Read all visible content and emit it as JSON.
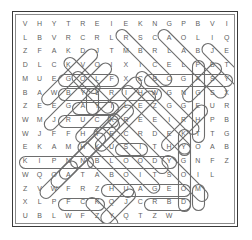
{
  "puzzle": {
    "title": "word-search-grid",
    "columns": 15,
    "rows": 15,
    "letter_color": "#5f5f5f",
    "mark_color": "#6d6d6d",
    "frame_color": "#3a3a3a",
    "inner_frame_color": "#8a8a8a",
    "background_color": "#ffffff",
    "grid": [
      [
        "V",
        "H",
        "Y",
        "T",
        "R",
        "E",
        "I",
        "E",
        "K",
        "N",
        "G",
        "P",
        "B",
        "V",
        "I"
      ],
      [
        "L",
        "B",
        "V",
        "R",
        "C",
        "R",
        "L",
        "R",
        "S",
        "C",
        "A",
        "O",
        "L",
        "I",
        "Q"
      ],
      [
        "Z",
        "F",
        "A",
        "K",
        "D",
        "J",
        "T",
        "M",
        "B",
        "R",
        "L",
        "A",
        "B",
        "J",
        "E"
      ],
      [
        "D",
        "L",
        "C",
        "K",
        "V",
        "O",
        "I",
        "X",
        "I",
        "C",
        "E",
        "L",
        "P",
        "B",
        "T"
      ],
      [
        "M",
        "U",
        "E",
        "G",
        "O",
        "L",
        "F",
        "X",
        "C",
        "B",
        "O",
        "G",
        "A",
        "S",
        "Y"
      ],
      [
        "B",
        "A",
        "W",
        "B",
        "Y",
        "L",
        "R",
        "I",
        "H",
        "W",
        "G",
        "N",
        "G",
        "S",
        "X"
      ],
      [
        "Z",
        "E",
        "E",
        "G",
        "A",
        "Y",
        "I",
        "L",
        "E",
        "Z",
        "G",
        "G",
        "E",
        "U",
        "R"
      ],
      [
        "W",
        "M",
        "J",
        "R",
        "U",
        "C",
        "K",
        "R",
        "E",
        "E",
        "I",
        "R",
        "H",
        "P",
        "B"
      ],
      [
        "W",
        "J",
        "F",
        "F",
        "H",
        "T",
        "E",
        "C",
        "R",
        "D",
        "E",
        "K",
        "T",
        "T",
        "G"
      ],
      [
        "E",
        "K",
        "A",
        "M",
        "H",
        "K",
        "U",
        "S",
        "I",
        "T",
        "H",
        "Y",
        "O",
        "A",
        "B"
      ],
      [
        "K",
        "I",
        "P",
        "N",
        "N",
        "B",
        "L",
        "O",
        "O",
        "D",
        "Y",
        "G",
        "N",
        "F",
        "Z"
      ],
      [
        "W",
        "Q",
        "O",
        "A",
        "T",
        "A",
        "B",
        "O",
        "I",
        "T",
        "S",
        "O",
        "I",
        "L",
        ""
      ],
      [
        "Z",
        "V",
        "W",
        "F",
        "R",
        "Z",
        "H",
        "U",
        "A",
        "G",
        "E",
        "O",
        "M",
        "",
        ""
      ],
      [
        "X",
        "L",
        "P",
        "F",
        "C",
        "K",
        "Q",
        "J",
        "C",
        "R",
        "B",
        "D",
        "",
        "",
        ""
      ],
      [
        "U",
        "B",
        "L",
        "W",
        "F",
        "Z",
        "Y",
        "Q",
        "T",
        "Z",
        "W",
        "",
        "",
        "",
        ""
      ]
    ],
    "found_words": [
      {
        "word": "GOLF",
        "start": [
          4,
          3
        ],
        "end": [
          4,
          6
        ],
        "orientation": "horizontal"
      },
      {
        "word": "BLOODY",
        "start": [
          10,
          5
        ],
        "end": [
          10,
          10
        ],
        "orientation": "horizontal"
      },
      {
        "word": "RUCK",
        "start": [
          7,
          3
        ],
        "end": [
          7,
          6
        ],
        "orientation": "horizontal"
      },
      {
        "word": "KIPNN",
        "start": [
          10,
          0
        ],
        "end": [
          10,
          4
        ],
        "orientation": "horizontal"
      },
      {
        "word": "CBOGASY",
        "start": [
          4,
          9
        ],
        "end": [
          4,
          14
        ],
        "orientation": "horizontal"
      },
      {
        "word": "BYLRIHW",
        "start": [
          5,
          3
        ],
        "end": [
          5,
          9
        ],
        "orientation": "horizontal"
      },
      {
        "word": "HUAGEO",
        "start": [
          12,
          6
        ],
        "end": [
          12,
          11
        ],
        "orientation": "horizontal"
      },
      {
        "word": "FCK",
        "start": [
          13,
          3
        ],
        "end": [
          13,
          5
        ],
        "orientation": "horizontal"
      },
      {
        "word": "RBD",
        "start": [
          13,
          9
        ],
        "end": [
          13,
          11
        ],
        "orientation": "horizontal"
      },
      {
        "word": "DIAG1",
        "start": [
          0,
          7
        ],
        "end": [
          4,
          11
        ],
        "orientation": "diagonal-down-right"
      },
      {
        "word": "DIAG2",
        "start": [
          0,
          10
        ],
        "end": [
          6,
          14
        ],
        "orientation": "diagonal-down-right"
      },
      {
        "word": "DIAG3",
        "start": [
          2,
          5
        ],
        "end": [
          7,
          0
        ],
        "orientation": "diagonal-down-left"
      },
      {
        "word": "DIAG4",
        "start": [
          3,
          5
        ],
        "end": [
          9,
          0
        ],
        "orientation": "diagonal-down-left"
      },
      {
        "word": "DIAG5",
        "start": [
          9,
          4
        ],
        "end": [
          13,
          8
        ],
        "orientation": "diagonal-down-right"
      },
      {
        "word": "VERT1",
        "start": [
          3,
          12
        ],
        "end": [
          8,
          12
        ],
        "orientation": "vertical"
      },
      {
        "word": "VERT2",
        "start": [
          9,
          12
        ],
        "end": [
          12,
          12
        ],
        "orientation": "vertical"
      },
      {
        "word": "VERT3",
        "start": [
          12,
          12
        ],
        "end": [
          13,
          12
        ],
        "orientation": "vertical"
      }
    ]
  }
}
